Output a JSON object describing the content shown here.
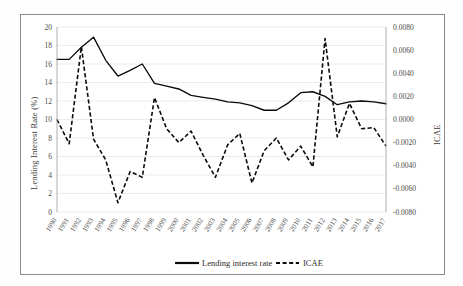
{
  "chart_data": {
    "type": "line",
    "title": "",
    "xlabel": "",
    "ylabel": "Lending Interest Rate (%)",
    "y2label": "ICAE",
    "grid": true,
    "legend_position": "bottom",
    "ylim": [
      0,
      20
    ],
    "ytick_step": 2,
    "y2lim": [
      -0.008,
      0.008
    ],
    "y2tick_step": 0.002,
    "yticks": [
      "0",
      "2",
      "4",
      "6",
      "8",
      "10",
      "12",
      "14",
      "16",
      "18",
      "20"
    ],
    "y2ticks": [
      "-0.0080",
      "-0.0060",
      "-0.0040",
      "-0.0020",
      "0.0000",
      "0.0020",
      "0.0040",
      "0.0060",
      "0.0080"
    ],
    "categories": [
      "1990",
      "1991",
      "1992",
      "1993",
      "1994",
      "1995",
      "1996",
      "1997",
      "1998",
      "1999",
      "2000",
      "2001",
      "2002",
      "2003",
      "2004",
      "2005",
      "2006",
      "2007",
      "2008",
      "2009",
      "2010",
      "2011",
      "2012",
      "2013",
      "2014",
      "2015",
      "2016",
      "2017"
    ],
    "series": [
      {
        "name": "Lending interest rate",
        "axis": "left",
        "style": "solid",
        "values": [
          16.5,
          16.5,
          17.8,
          18.9,
          16.4,
          14.7,
          15.3,
          16.0,
          13.9,
          13.6,
          13.3,
          12.6,
          12.4,
          12.2,
          11.9,
          11.8,
          11.5,
          11.0,
          11.0,
          11.8,
          12.9,
          13.0,
          12.5,
          11.6,
          11.9,
          12.0,
          11.9,
          11.7
        ]
      },
      {
        "name": "ICAE",
        "axis": "right",
        "style": "dashed",
        "values": [
          0.0,
          -0.0021,
          0.0063,
          -0.0017,
          -0.0035,
          -0.0072,
          -0.0045,
          -0.005,
          0.0019,
          -0.0008,
          -0.002,
          -0.001,
          -0.0031,
          -0.005,
          -0.0022,
          -0.0012,
          -0.0055,
          -0.0027,
          -0.0016,
          -0.0035,
          -0.0023,
          -0.0041,
          0.007,
          -0.0015,
          0.0014,
          -0.0008,
          -0.0007,
          -0.0023
        ]
      }
    ],
    "legend": [
      {
        "label": "Lending interest rate",
        "style": "solid"
      },
      {
        "label": "ICAE",
        "style": "dashed"
      }
    ]
  }
}
